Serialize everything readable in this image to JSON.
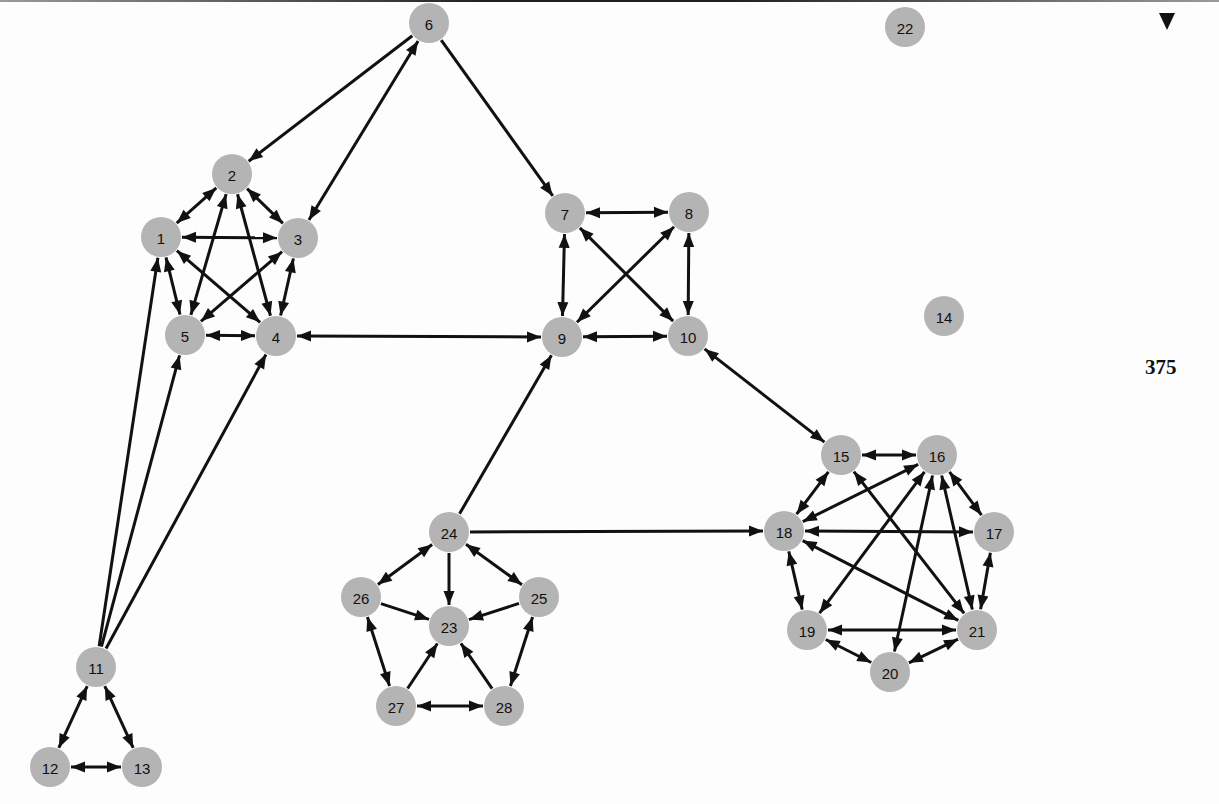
{
  "page": {
    "page_number": "375",
    "marker_icon": "down-triangle-icon"
  },
  "style": {
    "node_fill": "#b4b4b4",
    "edge_color": "#111111",
    "background": "#fdfdfd"
  },
  "graph": {
    "node_radius": 20,
    "nodes": [
      {
        "id": "1",
        "x": 161,
        "y": 237
      },
      {
        "id": "2",
        "x": 232,
        "y": 174
      },
      {
        "id": "3",
        "x": 298,
        "y": 238
      },
      {
        "id": "4",
        "x": 276,
        "y": 336
      },
      {
        "id": "5",
        "x": 185,
        "y": 335
      },
      {
        "id": "6",
        "x": 429,
        "y": 23
      },
      {
        "id": "7",
        "x": 565,
        "y": 213
      },
      {
        "id": "8",
        "x": 689,
        "y": 212
      },
      {
        "id": "9",
        "x": 562,
        "y": 337
      },
      {
        "id": "10",
        "x": 688,
        "y": 336
      },
      {
        "id": "11",
        "x": 96,
        "y": 667
      },
      {
        "id": "12",
        "x": 50,
        "y": 767
      },
      {
        "id": "13",
        "x": 142,
        "y": 767
      },
      {
        "id": "14",
        "x": 944,
        "y": 316
      },
      {
        "id": "15",
        "x": 841,
        "y": 455
      },
      {
        "id": "16",
        "x": 937,
        "y": 455
      },
      {
        "id": "17",
        "x": 994,
        "y": 532
      },
      {
        "id": "18",
        "x": 784,
        "y": 531
      },
      {
        "id": "19",
        "x": 807,
        "y": 630
      },
      {
        "id": "20",
        "x": 890,
        "y": 672
      },
      {
        "id": "21",
        "x": 977,
        "y": 630
      },
      {
        "id": "22",
        "x": 905,
        "y": 27
      },
      {
        "id": "23",
        "x": 449,
        "y": 626
      },
      {
        "id": "24",
        "x": 449,
        "y": 532
      },
      {
        "id": "25",
        "x": 539,
        "y": 597
      },
      {
        "id": "26",
        "x": 361,
        "y": 597
      },
      {
        "id": "27",
        "x": 396,
        "y": 706
      },
      {
        "id": "28",
        "x": 504,
        "y": 706
      }
    ],
    "edges": [
      {
        "from": "1",
        "to": "2",
        "arrow": "both"
      },
      {
        "from": "1",
        "to": "3",
        "arrow": "both"
      },
      {
        "from": "1",
        "to": "4",
        "arrow": "both"
      },
      {
        "from": "1",
        "to": "5",
        "arrow": "both"
      },
      {
        "from": "2",
        "to": "3",
        "arrow": "both"
      },
      {
        "from": "2",
        "to": "4",
        "arrow": "both"
      },
      {
        "from": "2",
        "to": "5",
        "arrow": "both"
      },
      {
        "from": "3",
        "to": "4",
        "arrow": "both"
      },
      {
        "from": "3",
        "to": "5",
        "arrow": "both"
      },
      {
        "from": "4",
        "to": "5",
        "arrow": "both"
      },
      {
        "from": "6",
        "to": "2",
        "arrow": "forward"
      },
      {
        "from": "6",
        "to": "3",
        "arrow": "both"
      },
      {
        "from": "6",
        "to": "7",
        "arrow": "forward"
      },
      {
        "from": "7",
        "to": "8",
        "arrow": "both"
      },
      {
        "from": "7",
        "to": "9",
        "arrow": "both"
      },
      {
        "from": "7",
        "to": "10",
        "arrow": "both"
      },
      {
        "from": "8",
        "to": "9",
        "arrow": "both"
      },
      {
        "from": "8",
        "to": "10",
        "arrow": "both"
      },
      {
        "from": "9",
        "to": "10",
        "arrow": "both"
      },
      {
        "from": "4",
        "to": "9",
        "arrow": "both"
      },
      {
        "from": "10",
        "to": "15",
        "arrow": "both"
      },
      {
        "from": "11",
        "to": "1",
        "arrow": "forward"
      },
      {
        "from": "11",
        "to": "5",
        "arrow": "forward"
      },
      {
        "from": "11",
        "to": "4",
        "arrow": "forward"
      },
      {
        "from": "11",
        "to": "12",
        "arrow": "both"
      },
      {
        "from": "11",
        "to": "13",
        "arrow": "both"
      },
      {
        "from": "12",
        "to": "13",
        "arrow": "both"
      },
      {
        "from": "24",
        "to": "9",
        "arrow": "forward"
      },
      {
        "from": "24",
        "to": "18",
        "arrow": "forward"
      },
      {
        "from": "24",
        "to": "23",
        "arrow": "forward"
      },
      {
        "from": "24",
        "to": "26",
        "arrow": "both"
      },
      {
        "from": "24",
        "to": "25",
        "arrow": "both"
      },
      {
        "from": "26",
        "to": "23",
        "arrow": "forward"
      },
      {
        "from": "25",
        "to": "23",
        "arrow": "forward"
      },
      {
        "from": "27",
        "to": "23",
        "arrow": "forward"
      },
      {
        "from": "28",
        "to": "23",
        "arrow": "forward"
      },
      {
        "from": "26",
        "to": "27",
        "arrow": "both"
      },
      {
        "from": "25",
        "to": "28",
        "arrow": "both"
      },
      {
        "from": "27",
        "to": "28",
        "arrow": "both"
      },
      {
        "from": "15",
        "to": "16",
        "arrow": "both"
      },
      {
        "from": "15",
        "to": "18",
        "arrow": "both"
      },
      {
        "from": "15",
        "to": "21",
        "arrow": "both"
      },
      {
        "from": "16",
        "to": "17",
        "arrow": "both"
      },
      {
        "from": "16",
        "to": "18",
        "arrow": "both"
      },
      {
        "from": "16",
        "to": "19",
        "arrow": "both"
      },
      {
        "from": "16",
        "to": "20",
        "arrow": "both"
      },
      {
        "from": "16",
        "to": "21",
        "arrow": "both"
      },
      {
        "from": "18",
        "to": "17",
        "arrow": "both"
      },
      {
        "from": "18",
        "to": "19",
        "arrow": "both"
      },
      {
        "from": "18",
        "to": "21",
        "arrow": "both"
      },
      {
        "from": "17",
        "to": "21",
        "arrow": "both"
      },
      {
        "from": "19",
        "to": "21",
        "arrow": "both"
      },
      {
        "from": "19",
        "to": "20",
        "arrow": "both"
      },
      {
        "from": "20",
        "to": "21",
        "arrow": "both"
      }
    ]
  }
}
